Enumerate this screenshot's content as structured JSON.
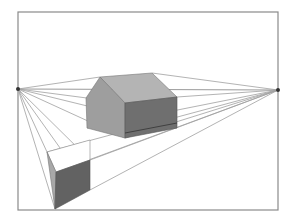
{
  "diagram": {
    "title": "Two-point perspective drawing",
    "frame": {
      "x1": 18,
      "y1": 12,
      "x2": 278,
      "y2": 210,
      "color": "#8a8a8a"
    },
    "horizon": {
      "y_left": 89,
      "y_right": 90,
      "color": "#9a9a9a"
    },
    "vanishing_points": [
      {
        "name": "left-vanishing-point",
        "x": 18,
        "y": 89
      },
      {
        "name": "right-vanishing-point",
        "x": 278,
        "y": 90
      }
    ],
    "colors": {
      "line": "#a0a0a0",
      "house_front": "#9e9e9e",
      "house_side": "#6f6f6f",
      "house_roof": "#b4b4b4",
      "box_top": "#ffffff",
      "box_left": "#a8a8a8",
      "box_front": "#626262",
      "point": "#333333"
    }
  }
}
